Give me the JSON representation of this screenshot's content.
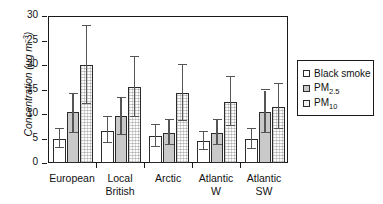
{
  "chart_data": {
    "type": "bar",
    "title": "",
    "subtitle": "",
    "xlabel": "",
    "ylabel": "Concentration (µg m−3)",
    "ylim": [
      0,
      30
    ],
    "yticks": [
      0,
      5,
      10,
      15,
      20,
      25,
      30
    ],
    "ytick_labels": [
      "0",
      "5",
      "10",
      "15",
      "20",
      "25",
      "30"
    ],
    "grid": false,
    "legend_position": "right",
    "categories": [
      "European",
      "Local British",
      "Arctic",
      "Atlantic W",
      "Atlantic SW"
    ],
    "category_lines": [
      [
        "European"
      ],
      [
        "Local",
        "British"
      ],
      [
        "Arctic"
      ],
      [
        "Atlantic",
        "W"
      ],
      [
        "Atlantic",
        "SW"
      ]
    ],
    "series": [
      {
        "name": "Black smoke",
        "fill": "white",
        "values": [
          5.0,
          6.6,
          5.6,
          4.4,
          4.9
        ],
        "err_low": [
          3.0,
          4.0,
          3.3,
          2.6,
          2.8
        ],
        "err_high": [
          7.0,
          9.3,
          7.8,
          6.3,
          6.9
        ]
      },
      {
        "name": "PM2.5",
        "name_base": "PM",
        "name_sub": "2.5",
        "fill": "grey",
        "values": [
          10.5,
          9.5,
          6.2,
          6.2,
          10.5
        ],
        "err_low": [
          6.2,
          5.8,
          3.6,
          3.6,
          6.2
        ],
        "err_high": [
          14.0,
          13.2,
          8.7,
          8.7,
          14.8
        ]
      },
      {
        "name": "PM10",
        "name_base": "PM",
        "name_sub": "10",
        "fill": "dotted",
        "values": [
          20.0,
          15.6,
          14.3,
          12.5,
          11.5
        ],
        "err_low": [
          12.0,
          9.3,
          8.6,
          7.6,
          6.9
        ],
        "err_high": [
          28.0,
          21.7,
          20.0,
          17.6,
          16.2
        ]
      }
    ]
  },
  "legend": {
    "items": [
      {
        "label": "Black smoke",
        "base": "Black smoke",
        "sub": "",
        "swatch": "series-black-smoke"
      },
      {
        "label": "PM2.5",
        "base": "PM",
        "sub": "2.5",
        "swatch": "series-pm25"
      },
      {
        "label": "PM10",
        "base": "PM",
        "sub": "10",
        "swatch": "series-pm10"
      }
    ]
  },
  "axis": {
    "y_title_base": "Concentration (µg m",
    "y_title_sup": "−3",
    "y_title_tail": ")"
  },
  "colors": {
    "frame": "#1a1a1a",
    "bar_outline": "#2b2b2b",
    "error_bar": "#555555",
    "pm25_fill": "#c9c9c9",
    "pm10_fill": "#fbfbfb",
    "background": "#ffffff"
  }
}
